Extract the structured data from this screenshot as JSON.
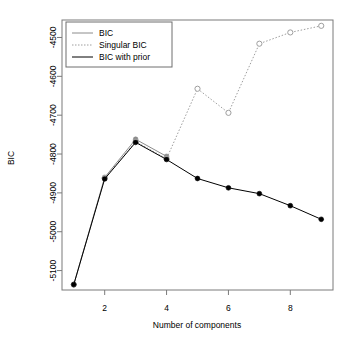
{
  "chart_data": {
    "type": "line",
    "title": "",
    "xlabel": "Number of components",
    "ylabel": "BIC",
    "x": [
      1,
      2,
      3,
      4,
      5,
      6,
      7,
      8,
      9
    ],
    "xlim": [
      0.62,
      9.38
    ],
    "ylim": [
      -5150,
      -4455
    ],
    "xticks": [
      2,
      4,
      6,
      8
    ],
    "xtick_labels": [
      "2",
      "4",
      "6",
      "8"
    ],
    "yticks": [
      -4500,
      -4600,
      -4700,
      -4800,
      -4900,
      -5000,
      -5100
    ],
    "ytick_labels": [
      "-4500",
      "-4600",
      "-4700",
      "-4800",
      "-4900",
      "-5000",
      "-5100"
    ],
    "grid": false,
    "legend_position": "top-left",
    "series": [
      {
        "name": "BIC",
        "color": "#8c8c8c",
        "line_style": "solid",
        "marker": "filled-circle",
        "x": [
          1,
          2,
          3,
          4
        ],
        "values": [
          -5136,
          -4860,
          -4762,
          -4806
        ]
      },
      {
        "name": "Singular BIC",
        "color": "#9e9e9e",
        "line_style": "dotted",
        "marker": "open-circle",
        "x": [
          1,
          2,
          3,
          4,
          5,
          6,
          7,
          8,
          9
        ],
        "values": [
          -5136,
          -4862,
          -4768,
          -4812,
          -4632,
          -4694,
          -4516,
          -4487,
          -4470
        ]
      },
      {
        "name": "BIC with prior",
        "color": "#000000",
        "line_style": "solid",
        "marker": "filled-circle",
        "x": [
          1,
          2,
          3,
          4,
          5,
          6,
          7,
          8,
          9
        ],
        "values": [
          -5136,
          -4864,
          -4770,
          -4814,
          -4863,
          -4887,
          -4902,
          -4933,
          -4968
        ]
      }
    ]
  },
  "axes": {
    "x_label": "Number of components",
    "y_label": "BIC"
  },
  "legend": {
    "entries": [
      {
        "label": "BIC"
      },
      {
        "label": "Singular BIC"
      },
      {
        "label": "BIC with prior"
      }
    ]
  }
}
